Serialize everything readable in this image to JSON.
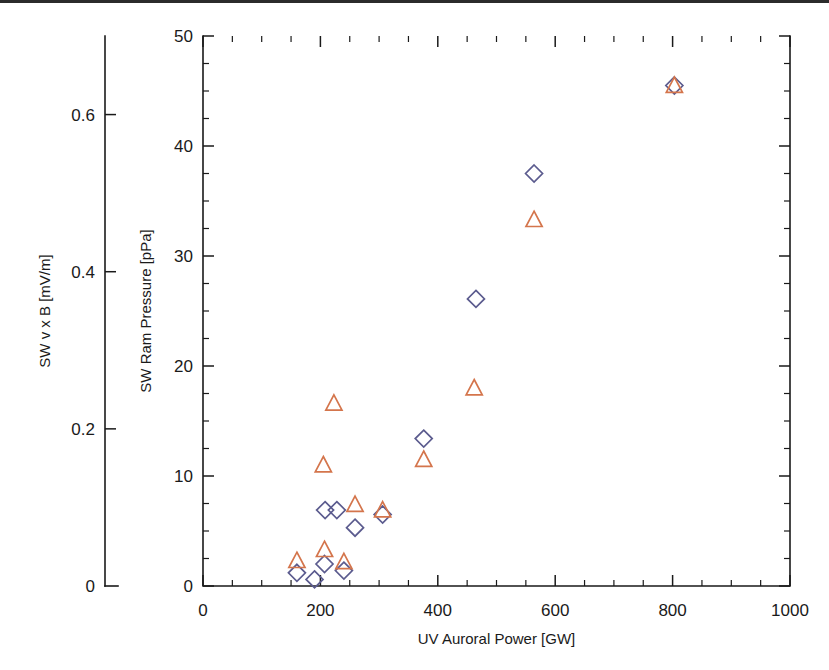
{
  "figure": {
    "background": "#ffffff",
    "has_top_rule": true,
    "rule_color": "#2b2b2b"
  },
  "chart_data": {
    "type": "scatter",
    "title": "",
    "xlabel": "UV Auroral Power [GW]",
    "ylabel": "SW Ram Pressure [pPa]",
    "y2label": "SW v x B [mV/m]",
    "xlim": [
      0,
      1000
    ],
    "ylim": [
      0,
      50
    ],
    "y2lim": [
      0,
      0.7
    ],
    "grid": false,
    "legend_position": "none",
    "xticks": [
      0,
      200,
      400,
      600,
      800,
      1000
    ],
    "xticklabels": [
      "0",
      "200",
      "400",
      "600",
      "800",
      "1000"
    ],
    "yticks": [
      0,
      10,
      20,
      30,
      40,
      50
    ],
    "yticklabels": [
      "0",
      "10",
      "20",
      "30",
      "40",
      "50"
    ],
    "y2ticks": [
      0,
      0.2,
      0.4,
      0.6
    ],
    "y2ticklabels": [
      "0",
      "0.2",
      "0.4",
      "0.6"
    ],
    "x_minor_interval": 50,
    "y_minor_interval": 2.5,
    "series": [
      {
        "name": "SW Ram Pressure",
        "marker": "diamond",
        "color": "#5b5b8e",
        "axis": "left",
        "points": [
          {
            "x": 160,
            "y": 1.2
          },
          {
            "x": 190,
            "y": 0.6
          },
          {
            "x": 207,
            "y": 2.0
          },
          {
            "x": 240,
            "y": 1.4
          },
          {
            "x": 208,
            "y": 6.9
          },
          {
            "x": 228,
            "y": 6.9
          },
          {
            "x": 259,
            "y": 5.3
          },
          {
            "x": 306,
            "y": 6.5
          },
          {
            "x": 376,
            "y": 13.4
          },
          {
            "x": 465,
            "y": 26.1
          },
          {
            "x": 564,
            "y": 37.5
          },
          {
            "x": 803,
            "y": 45.5
          }
        ]
      },
      {
        "name": "SW v x B",
        "marker": "triangle",
        "color": "#d4754c",
        "axis": "right",
        "points": [
          {
            "x": 160,
            "y": 2.3
          },
          {
            "x": 207,
            "y": 3.3
          },
          {
            "x": 240,
            "y": 2.2
          },
          {
            "x": 205,
            "y": 11.0
          },
          {
            "x": 223,
            "y": 16.6
          },
          {
            "x": 259,
            "y": 7.4
          },
          {
            "x": 306,
            "y": 6.9
          },
          {
            "x": 376,
            "y": 11.5
          },
          {
            "x": 462,
            "y": 18.0
          },
          {
            "x": 564,
            "y": 33.3
          },
          {
            "x": 803,
            "y": 45.5
          }
        ]
      }
    ]
  }
}
